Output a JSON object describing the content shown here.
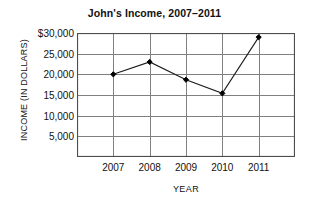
{
  "chart_data": {
    "type": "line",
    "title": "John's Income, 2007–2011",
    "xlabel": "YEAR",
    "ylabel": "INCOME (IN DOLLARS)",
    "categories": [
      "2007",
      "2008",
      "2009",
      "2010",
      "2011"
    ],
    "values": [
      20000,
      23000,
      18700,
      15400,
      29000
    ],
    "series": [
      {
        "name": "John's Income",
        "values": [
          20000,
          23000,
          18700,
          15400,
          29000
        ]
      }
    ],
    "ylim": [
      0,
      30000
    ],
    "ytick_values": [
      30000,
      25000,
      20000,
      15000,
      10000,
      5000
    ],
    "ytick_labels": [
      "$30,000",
      "25,000",
      "20,000",
      "15,000",
      "10,000",
      "5,000"
    ],
    "xtick_labels": [
      "2007",
      "2008",
      "2009",
      "2010",
      "2011"
    ],
    "grid": true,
    "grid_color": "#808080",
    "legend": null,
    "legend_position": "none",
    "line_color": "#1a1a1a",
    "marker": "diamond",
    "marker_color": "#000000",
    "annotations": []
  },
  "colors": {
    "background": "#ffffff",
    "axis": "#4d4d4d",
    "text": "#111111"
  }
}
